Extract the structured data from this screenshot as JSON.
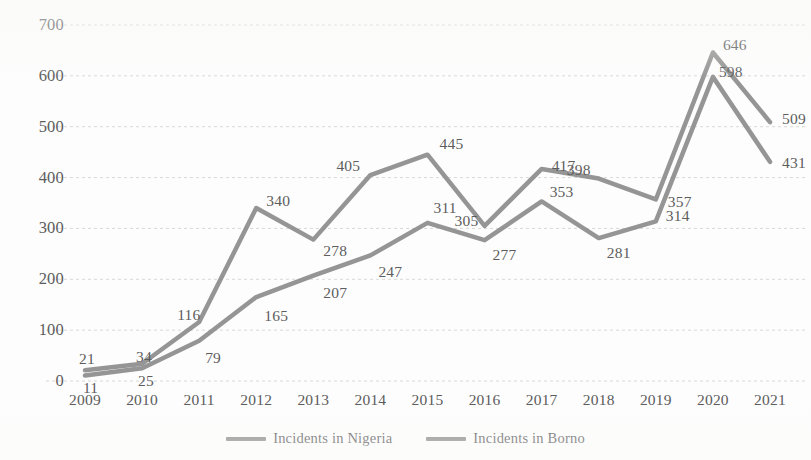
{
  "chart_data": {
    "type": "line",
    "title": "",
    "subtitle": "",
    "xlabel": "",
    "ylabel": "",
    "categories": [
      "2009",
      "2010",
      "2011",
      "2012",
      "2013",
      "2014",
      "2015",
      "2016",
      "2017",
      "2018",
      "2019",
      "2020",
      "2021"
    ],
    "series": [
      {
        "name": "Incidents in Nigeria",
        "color": "#8c8c8c",
        "values": [
          11,
          25,
          79,
          165,
          207,
          247,
          311,
          277,
          353,
          281,
          314,
          598,
          431
        ]
      },
      {
        "name": "Incidents in Borno",
        "color": "#8c8c8c",
        "values": [
          21,
          34,
          116,
          340,
          278,
          405,
          445,
          305,
          417,
          398,
          357,
          646,
          509
        ]
      }
    ],
    "ylim": [
      0,
      700
    ],
    "ytick_values": [
      0,
      100,
      200,
      300,
      400,
      500,
      600,
      700
    ],
    "ytick_labels": [
      "0",
      "100",
      "200",
      "300",
      "400",
      "500",
      "600",
      "700"
    ],
    "grid": true,
    "grid_axis": "y",
    "legend_position": "bottom",
    "data_labels": true,
    "annotations": []
  },
  "legend": {
    "items": [
      {
        "label": "Incidents in Nigeria",
        "color": "#8c8c8c"
      },
      {
        "label": "Incidents in Borno",
        "color": "#8c8c8c"
      }
    ]
  },
  "colors": {
    "background": "#fdfdfd",
    "gridline": "#d8d8d8",
    "axis_text": "#5c5c5c",
    "label_text": "#5d5d5d",
    "line_nigeria": "#8c8c8c",
    "line_borno": "#8c8c8c"
  }
}
